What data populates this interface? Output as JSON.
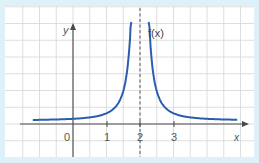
{
  "chart_data": {
    "type": "line",
    "title": "",
    "function_label": "f(x)",
    "xlabel": "x",
    "ylabel": "y",
    "x_ticks": [
      {
        "value": 0,
        "label": "0"
      },
      {
        "value": 1,
        "label": "1"
      },
      {
        "value": 2,
        "label": "2"
      },
      {
        "value": 3,
        "label": "3"
      }
    ],
    "xlim": [
      -1.2,
      4.7
    ],
    "ylim": [
      -0.65,
      3.6
    ],
    "grid": true,
    "grid_step": 0.5,
    "vertical_asymptote": {
      "x": 2,
      "style": "dashed"
    },
    "horizontal_asymptote": {
      "y": 0.1
    },
    "series": [
      {
        "name": "f(x)",
        "color": "#2a5fae",
        "x": [
          -1.2,
          -0.5,
          0,
          0.5,
          1,
          1.5,
          1.8,
          1.9,
          1.95,
          2.05,
          2.1,
          2.2,
          2.5,
          3,
          3.5,
          4,
          4.7
        ],
        "y": [
          0.12,
          0.13,
          0.15,
          0.2,
          0.35,
          0.9,
          2.2,
          3.2,
          3.6,
          3.6,
          3.2,
          2.2,
          0.9,
          0.35,
          0.2,
          0.15,
          0.12
        ]
      }
    ]
  },
  "labels": {
    "y_axis": "y",
    "x_axis": "x",
    "function": "f(x)",
    "tick_0": "0",
    "tick_1": "1",
    "tick_2": "2",
    "tick_3": "3"
  },
  "colors": {
    "border": "#dff1f8",
    "grid": "#d4d4d4",
    "axis": "#4a4a4a",
    "curve": "#2a5fae",
    "text": "#555555"
  }
}
